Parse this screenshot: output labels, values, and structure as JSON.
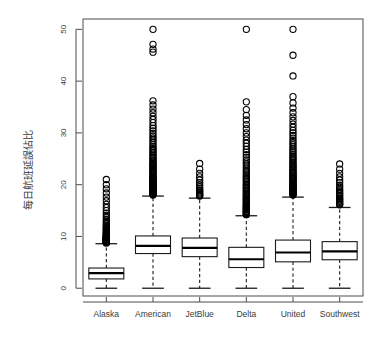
{
  "chart_data": {
    "type": "box",
    "title": "",
    "xlabel": "",
    "ylabel": "每日航班延誤佔比",
    "ylim": [
      -1.5,
      52
    ],
    "yticks": [
      0,
      10,
      20,
      30,
      40,
      50
    ],
    "ytick_labels": [
      "0",
      "10",
      "20",
      "30",
      "40",
      "50"
    ],
    "grid": false,
    "legend": "none",
    "categories": [
      "Alaska",
      "American",
      "JetBlue",
      "Delta",
      "United",
      "Southwest"
    ],
    "boxes": [
      {
        "name": "Alaska",
        "whisker_low": 0.0,
        "q1": 1.8,
        "median": 2.9,
        "q3": 3.9,
        "whisker_high": 8.6,
        "outliers": [
          21.0,
          20.0,
          19.2,
          18.4,
          17.6,
          16.9,
          16.2,
          15.6,
          15.0,
          14.5,
          14.1,
          13.7,
          13.3,
          13.0,
          12.7,
          12.4,
          12.1,
          11.9,
          11.7,
          11.5,
          11.3,
          11.1,
          10.9,
          10.8,
          10.6,
          10.5,
          10.4,
          10.3,
          10.2,
          10.1,
          10.0,
          9.9,
          9.8,
          9.75,
          9.7,
          9.65,
          9.6,
          9.55,
          9.5,
          9.45,
          9.4,
          9.35,
          9.3,
          9.25,
          9.2,
          9.15,
          9.1,
          9.05,
          9.0,
          8.95,
          8.9,
          8.85,
          8.8,
          8.75
        ]
      },
      {
        "name": "American",
        "whisker_low": 0.0,
        "q1": 6.7,
        "median": 8.2,
        "q3": 10.1,
        "whisker_high": 17.8,
        "outliers": [
          50.0,
          47.1,
          46.2,
          45.6,
          36.2,
          35.4,
          34.6,
          33.9,
          33.2,
          32.6,
          32.0,
          31.4,
          30.9,
          30.4,
          29.9,
          29.4,
          29.0,
          28.6,
          28.2,
          27.8,
          27.4,
          27.1,
          26.8,
          26.5,
          26.2,
          25.9,
          25.6,
          25.3,
          25.1,
          24.8,
          24.6,
          24.3,
          24.1,
          23.9,
          23.7,
          23.5,
          23.3,
          23.1,
          22.9,
          22.7,
          22.5,
          22.3,
          22.1,
          21.9,
          21.7,
          21.5,
          21.4,
          21.2,
          21.0,
          20.9,
          20.7,
          20.6,
          20.4,
          20.3,
          20.1,
          20.0,
          19.9,
          19.7,
          19.6,
          19.5,
          19.3,
          19.2,
          19.1,
          19.0,
          18.9,
          18.8,
          18.7,
          18.6,
          18.5,
          18.4,
          18.3,
          18.2,
          18.1,
          18.0
        ]
      },
      {
        "name": "JetBlue",
        "whisker_low": 0.0,
        "q1": 6.1,
        "median": 7.8,
        "q3": 9.7,
        "whisker_high": 17.4,
        "outliers": [
          24.1,
          23.0,
          22.2,
          21.5,
          20.9,
          20.4,
          20.0,
          19.6,
          19.3,
          19.0,
          18.8,
          18.6,
          18.4,
          18.2,
          18.0,
          17.9,
          17.8
        ]
      },
      {
        "name": "Delta",
        "whisker_low": 0.0,
        "q1": 4.0,
        "median": 5.6,
        "q3": 7.9,
        "whisker_high": 14.0,
        "outliers": [
          50.0,
          36.0,
          34.5,
          33.4,
          32.5,
          31.6,
          30.8,
          30.0,
          29.3,
          28.6,
          28.0,
          27.4,
          26.8,
          26.3,
          25.8,
          25.3,
          24.8,
          24.4,
          24.0,
          23.6,
          23.2,
          22.8,
          22.5,
          22.1,
          21.8,
          21.5,
          21.2,
          20.9,
          20.6,
          20.3,
          20.0,
          19.8,
          19.5,
          19.3,
          19.0,
          18.8,
          18.6,
          18.3,
          18.1,
          17.9,
          17.7,
          17.5,
          17.3,
          17.1,
          16.9,
          16.7,
          16.5,
          16.3,
          16.2,
          16.0,
          15.8,
          15.7,
          15.5,
          15.4,
          15.2,
          15.1,
          14.9,
          14.8,
          14.7,
          14.5,
          14.4,
          14.3,
          14.2
        ]
      },
      {
        "name": "United",
        "whisker_low": 0.0,
        "q1": 5.1,
        "median": 6.9,
        "q3": 9.3,
        "whisker_high": 17.6,
        "outliers": [
          50.0,
          45.0,
          41.0,
          37.0,
          35.8,
          34.8,
          33.9,
          33.1,
          32.4,
          31.7,
          31.1,
          30.5,
          30.0,
          29.5,
          29.0,
          28.5,
          28.1,
          27.7,
          27.3,
          26.9,
          26.5,
          26.2,
          25.8,
          25.5,
          25.2,
          24.9,
          24.6,
          24.3,
          24.0,
          23.8,
          23.5,
          23.3,
          23.0,
          22.8,
          22.5,
          22.3,
          22.1,
          21.9,
          21.7,
          21.5,
          21.3,
          21.1,
          20.9,
          20.7,
          20.5,
          20.4,
          20.2,
          20.0,
          19.9,
          19.7,
          19.6,
          19.4,
          19.3,
          19.1,
          19.0,
          18.9,
          18.7,
          18.6,
          18.5,
          18.4,
          18.3,
          18.2,
          18.1,
          18.0
        ]
      },
      {
        "name": "Southwest",
        "whisker_low": 0.0,
        "q1": 5.5,
        "median": 7.1,
        "q3": 9.0,
        "whisker_high": 15.6,
        "outliers": [
          24.0,
          23.0,
          22.2,
          21.5,
          20.9,
          20.4,
          19.9,
          19.5,
          19.1,
          18.8,
          18.5,
          18.2,
          17.9,
          17.7,
          17.4,
          17.2,
          17.0,
          16.8,
          16.6,
          16.4,
          16.2,
          16.1
        ]
      }
    ]
  }
}
